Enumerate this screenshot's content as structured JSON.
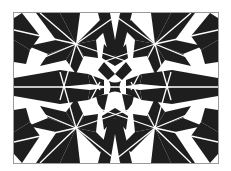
{
  "image": {
    "description": "Black and white geometric star pattern with white dividing lines inside a thin gray frame",
    "colors": {
      "background": "#ffffff",
      "fill": "#1e1e1e",
      "lines": "#ffffff",
      "frame": "#9a9a9a"
    },
    "frame": {
      "x": 13,
      "y": 12,
      "width": 206,
      "height": 152
    },
    "center": {
      "x": 115,
      "y": 87
    },
    "nodes": [
      {
        "x": 76,
        "y": 44
      },
      {
        "x": 155,
        "y": 44
      },
      {
        "x": 76,
        "y": 128
      },
      {
        "x": 155,
        "y": 128
      }
    ]
  }
}
